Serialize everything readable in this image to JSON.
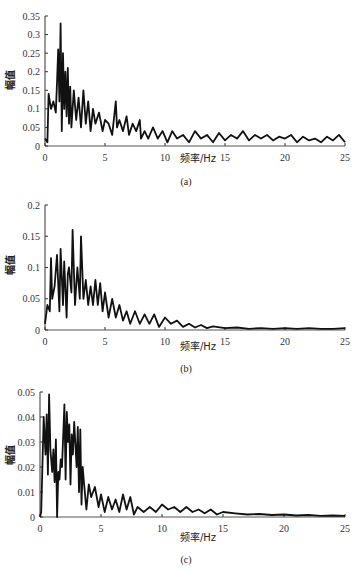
{
  "chart_data": [
    {
      "type": "line",
      "panel_label": "(a)",
      "xlabel": "频率/Hz",
      "ylabel": "幅值",
      "xlim": [
        0,
        25
      ],
      "ylim": [
        0,
        0.35
      ],
      "xticks": [
        0,
        5,
        10,
        15,
        20,
        25
      ],
      "yticks": [
        0,
        0.05,
        0.1,
        0.15,
        0.2,
        0.25,
        0.3,
        0.35
      ],
      "ytick_labels": [
        "0",
        "0.05",
        "0.1",
        "0.15",
        "0.2",
        "0.25",
        "0.3",
        "0.35"
      ],
      "grid": false,
      "series": [
        {
          "name": "spectrum",
          "x": [
            0,
            0.2,
            0.3,
            0.5,
            0.7,
            0.9,
            1.0,
            1.1,
            1.2,
            1.3,
            1.4,
            1.5,
            1.6,
            1.7,
            1.8,
            1.9,
            2.0,
            2.1,
            2.2,
            2.4,
            2.6,
            2.8,
            3.0,
            3.2,
            3.4,
            3.6,
            3.8,
            4.0,
            4.2,
            4.5,
            4.8,
            5.0,
            5.3,
            5.6,
            5.9,
            6.0,
            6.2,
            6.5,
            6.8,
            7.0,
            7.3,
            7.6,
            7.9,
            8.0,
            8.3,
            8.6,
            9.0,
            9.4,
            9.8,
            10.2,
            10.6,
            11.0,
            11.5,
            12.0,
            12.5,
            13.0,
            13.5,
            14.0,
            14.5,
            15.0,
            15.5,
            16.0,
            16.5,
            17.0,
            17.5,
            18.0,
            18.5,
            19.0,
            19.5,
            20.0,
            20.5,
            21.0,
            21.5,
            22.0,
            22.5,
            23.0,
            23.5,
            24.0,
            24.5,
            25.0
          ],
          "y": [
            0.02,
            0.01,
            0.14,
            0.1,
            0.12,
            0.09,
            0.17,
            0.26,
            0.12,
            0.33,
            0.04,
            0.25,
            0.1,
            0.2,
            0.08,
            0.21,
            0.06,
            0.16,
            0.05,
            0.15,
            0.07,
            0.13,
            0.05,
            0.15,
            0.06,
            0.12,
            0.04,
            0.1,
            0.06,
            0.09,
            0.04,
            0.07,
            0.06,
            0.03,
            0.12,
            0.05,
            0.07,
            0.04,
            0.08,
            0.03,
            0.06,
            0.04,
            0.07,
            0.02,
            0.04,
            0.02,
            0.05,
            0.02,
            0.04,
            0.01,
            0.04,
            0.02,
            0.03,
            0.01,
            0.04,
            0.02,
            0.03,
            0.01,
            0.035,
            0.015,
            0.03,
            0.02,
            0.04,
            0.015,
            0.03,
            0.02,
            0.03,
            0.015,
            0.025,
            0.02,
            0.03,
            0.01,
            0.025,
            0.015,
            0.02,
            0.01,
            0.025,
            0.015,
            0.03,
            0.01
          ]
        }
      ]
    },
    {
      "type": "line",
      "panel_label": "(b)",
      "xlabel": "频率/Hz",
      "ylabel": "幅值",
      "xlim": [
        0,
        25
      ],
      "ylim": [
        0,
        0.2
      ],
      "xticks": [
        0,
        5,
        10,
        15,
        20,
        25
      ],
      "yticks": [
        0,
        0.05,
        0.1,
        0.15,
        0.2
      ],
      "ytick_labels": [
        "0",
        "0.05",
        "0.1",
        "0.15",
        "0.2"
      ],
      "grid": false,
      "series": [
        {
          "name": "spectrum",
          "x": [
            0,
            0.2,
            0.4,
            0.5,
            0.6,
            0.8,
            1.0,
            1.2,
            1.3,
            1.5,
            1.6,
            1.8,
            1.9,
            2.0,
            2.2,
            2.3,
            2.5,
            2.7,
            2.9,
            3.0,
            3.2,
            3.4,
            3.6,
            3.8,
            4.0,
            4.2,
            4.4,
            4.6,
            4.8,
            5.0,
            5.3,
            5.6,
            5.9,
            6.2,
            6.5,
            6.8,
            7.1,
            7.5,
            7.9,
            8.3,
            8.7,
            9.1,
            9.5,
            10.0,
            10.5,
            11.0,
            11.5,
            12.0,
            12.5,
            13.0,
            13.5,
            14.0,
            15.0,
            16.0,
            17.0,
            18.0,
            19.0,
            20.0,
            21.0,
            22.0,
            23.0,
            24.0,
            25.0
          ],
          "y": [
            0.01,
            0.04,
            0.03,
            0.115,
            0.05,
            0.07,
            0.12,
            0.03,
            0.13,
            0.04,
            0.11,
            0.02,
            0.09,
            0.1,
            0.06,
            0.16,
            0.04,
            0.1,
            0.05,
            0.15,
            0.05,
            0.08,
            0.04,
            0.07,
            0.04,
            0.08,
            0.04,
            0.075,
            0.03,
            0.06,
            0.02,
            0.05,
            0.02,
            0.04,
            0.015,
            0.03,
            0.01,
            0.03,
            0.01,
            0.025,
            0.01,
            0.025,
            0.005,
            0.02,
            0.01,
            0.015,
            0.005,
            0.01,
            0.004,
            0.008,
            0.003,
            0.006,
            0.003,
            0.004,
            0.002,
            0.003,
            0.002,
            0.003,
            0.002,
            0.003,
            0.002,
            0.002,
            0.003
          ]
        }
      ]
    },
    {
      "type": "line",
      "panel_label": "(c)",
      "xlabel": "频率/Hz",
      "ylabel": "幅值",
      "xlim": [
        0,
        25
      ],
      "ylim": [
        0,
        0.05
      ],
      "xticks": [
        0,
        5,
        10,
        15,
        20,
        25
      ],
      "yticks": [
        0,
        0.01,
        0.02,
        0.03,
        0.04,
        0.05
      ],
      "ytick_labels": [
        "0",
        "0.01",
        "0.02",
        "0.03",
        "0.04",
        "0.05"
      ],
      "grid": false,
      "series": [
        {
          "name": "spectrum",
          "x": [
            0,
            0.1,
            0.3,
            0.45,
            0.55,
            0.65,
            0.75,
            0.85,
            1.0,
            1.1,
            1.2,
            1.3,
            1.4,
            1.5,
            1.6,
            1.7,
            1.8,
            2.0,
            2.1,
            2.2,
            2.3,
            2.4,
            2.5,
            2.6,
            2.7,
            2.8,
            3.0,
            3.1,
            3.2,
            3.3,
            3.4,
            3.5,
            3.6,
            3.8,
            4.0,
            4.2,
            4.5,
            4.8,
            5.0,
            5.3,
            5.6,
            5.9,
            6.2,
            6.5,
            6.8,
            7.1,
            7.4,
            7.7,
            8.0,
            8.5,
            9.0,
            9.5,
            10.0,
            10.5,
            11.0,
            11.5,
            12.0,
            12.5,
            13.0,
            13.5,
            14.0,
            14.5,
            15.0,
            16.0,
            17.0,
            18.0,
            19.0,
            20.0,
            21.0,
            22.0,
            23.0,
            24.0,
            25.0
          ],
          "y": [
            0.0,
            0.002,
            0.04,
            0.025,
            0.041,
            0.017,
            0.049,
            0.027,
            0.018,
            0.027,
            0.014,
            0.031,
            0.0,
            0.018,
            0.015,
            0.023,
            0.02,
            0.045,
            0.015,
            0.042,
            0.03,
            0.037,
            0.013,
            0.033,
            0.025,
            0.038,
            0.02,
            0.036,
            0.01,
            0.035,
            0.005,
            0.02,
            0.014,
            0.003,
            0.013,
            0.008,
            0.012,
            0.004,
            0.009,
            0.002,
            0.008,
            0.003,
            0.007,
            0.002,
            0.009,
            0.003,
            0.008,
            0.001,
            0.004,
            0.002,
            0.004,
            0.002,
            0.005,
            0.003,
            0.004,
            0.002,
            0.004,
            0.002,
            0.003,
            0.0015,
            0.003,
            0.001,
            0.002,
            0.0015,
            0.001,
            0.0012,
            0.0008,
            0.001,
            0.0006,
            0.0008,
            0.0005,
            0.0006,
            0.0005
          ]
        }
      ]
    }
  ]
}
